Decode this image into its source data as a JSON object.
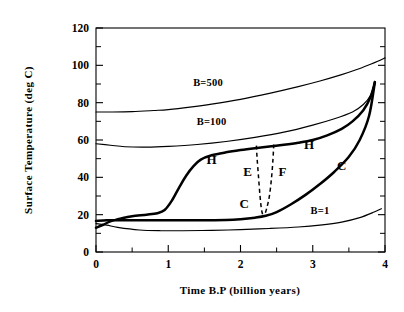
{
  "chart_data": {
    "type": "line",
    "title": "",
    "xlabel": "Time B.P (billion years)",
    "ylabel": "Surface Temperature (deg C)",
    "xlim": [
      0,
      4
    ],
    "ylim": [
      0,
      120
    ],
    "xticks": [
      0,
      1,
      2,
      3,
      4
    ],
    "yticks": [
      0,
      20,
      40,
      60,
      80,
      100,
      120
    ],
    "xticklabels": [
      "0",
      "1",
      "2",
      "3",
      "4"
    ],
    "yticklabels": [
      "0",
      "20",
      "40",
      "60",
      "80",
      "100",
      "120"
    ],
    "x_minor_ticks": [
      0.5,
      1.5,
      2.5,
      3.5
    ],
    "y_minor_ticks": [
      10,
      30,
      50,
      70,
      90,
      110
    ],
    "grid": false,
    "legend": "inline-annotations",
    "series": [
      {
        "name": "B=500",
        "label": "B=500",
        "style": "solid-thin",
        "x": [
          0.0,
          0.2,
          0.5,
          0.8,
          1.0,
          1.3,
          1.6,
          2.0,
          2.4,
          2.8,
          3.1,
          3.4,
          3.6,
          3.8,
          3.9,
          4.0
        ],
        "y": [
          75.0,
          75.0,
          75.2,
          75.8,
          76.3,
          77.6,
          79.2,
          81.8,
          85.0,
          88.6,
          91.6,
          95.0,
          97.6,
          100.6,
          102.2,
          104.0
        ]
      },
      {
        "name": "B=100",
        "label": "B=100",
        "style": "solid-thin",
        "x": [
          0.0,
          0.2,
          0.4,
          0.7,
          1.0,
          1.4,
          1.8,
          2.2,
          2.6,
          3.0,
          3.3,
          3.55,
          3.7,
          3.8,
          3.86
        ],
        "y": [
          58.0,
          57.2,
          56.4,
          56.2,
          56.6,
          57.6,
          59.2,
          61.4,
          64.2,
          68.0,
          71.4,
          75.0,
          79.0,
          84.0,
          91.0
        ]
      },
      {
        "name": "B=1",
        "label": "B=1",
        "style": "solid-thin",
        "x": [
          0.0,
          0.15,
          0.3,
          0.6,
          0.9,
          1.2,
          1.6,
          2.0,
          2.4,
          2.8,
          3.1,
          3.4,
          3.65,
          3.85,
          3.95
        ],
        "y": [
          15.2,
          14.4,
          13.2,
          11.8,
          11.4,
          11.4,
          11.6,
          12.0,
          12.6,
          13.4,
          14.4,
          16.0,
          18.4,
          21.4,
          23.2
        ]
      },
      {
        "name": "hot-branch",
        "label": "H",
        "style": "solid-thick",
        "description": "Upper (hot) branch of the hysteresis loop",
        "x": [
          0.0,
          0.1,
          0.2,
          0.35,
          0.5,
          0.7,
          0.85,
          0.95,
          1.05,
          1.15,
          1.25,
          1.35,
          1.45,
          1.6,
          1.8,
          2.0,
          2.2,
          2.4,
          2.6,
          2.8,
          3.0,
          3.2,
          3.4,
          3.55,
          3.7,
          3.8,
          3.86
        ],
        "y": [
          13.0,
          14.6,
          16.4,
          18.0,
          19.2,
          20.0,
          20.8,
          22.5,
          27.5,
          34.5,
          41.0,
          46.0,
          49.5,
          51.8,
          53.4,
          54.6,
          55.6,
          56.5,
          57.4,
          58.5,
          60.0,
          62.5,
          66.0,
          70.0,
          76.0,
          83.0,
          91.0
        ]
      },
      {
        "name": "cold-branch",
        "label": "C",
        "style": "solid-thick",
        "description": "Lower (cold) branch of the hysteresis loop",
        "x": [
          0.0,
          0.15,
          0.3,
          0.6,
          1.0,
          1.4,
          1.8,
          2.0,
          2.2,
          2.35,
          2.5,
          2.7,
          2.9,
          3.1,
          3.3,
          3.5,
          3.65,
          3.78,
          3.86
        ],
        "y": [
          16.6,
          17.0,
          17.0,
          17.0,
          17.0,
          17.0,
          17.2,
          17.6,
          18.4,
          19.4,
          21.4,
          25.6,
          30.6,
          36.4,
          43.0,
          51.0,
          60.0,
          73.0,
          91.0
        ]
      },
      {
        "name": "transition-E",
        "label": "E",
        "style": "dashed",
        "description": "Dashed transition line from hot branch down to cold branch",
        "x": [
          2.22,
          2.23,
          2.25,
          2.27,
          2.29,
          2.31
        ],
        "y": [
          57.0,
          50.0,
          40.0,
          30.0,
          23.0,
          19.6
        ]
      },
      {
        "name": "transition-F",
        "label": "F",
        "style": "dashed",
        "description": "Dashed transition line from hot branch down to cold branch",
        "x": [
          2.46,
          2.45,
          2.43,
          2.4,
          2.36,
          2.33
        ],
        "y": [
          57.6,
          50.0,
          40.0,
          30.0,
          23.0,
          19.6
        ]
      }
    ],
    "annotations": [
      {
        "name": "label-b500",
        "text": "B=500",
        "x": 1.55,
        "y": 89.0
      },
      {
        "name": "label-b100",
        "text": "B=100",
        "x": 1.6,
        "y": 68.0
      },
      {
        "name": "label-b1",
        "text": "B=1",
        "x": 3.1,
        "y": 20.5
      },
      {
        "name": "label-h-left",
        "text": "H",
        "x": 1.6,
        "y": 47.0
      },
      {
        "name": "label-h-right",
        "text": "H",
        "x": 2.95,
        "y": 55.0
      },
      {
        "name": "label-c-left",
        "text": "C",
        "x": 2.05,
        "y": 23.5
      },
      {
        "name": "label-c-right",
        "text": "C",
        "x": 3.4,
        "y": 44.0
      },
      {
        "name": "label-e",
        "text": "E",
        "x": 2.1,
        "y": 41.0
      },
      {
        "name": "label-f",
        "text": "F",
        "x": 2.58,
        "y": 41.0
      }
    ]
  }
}
